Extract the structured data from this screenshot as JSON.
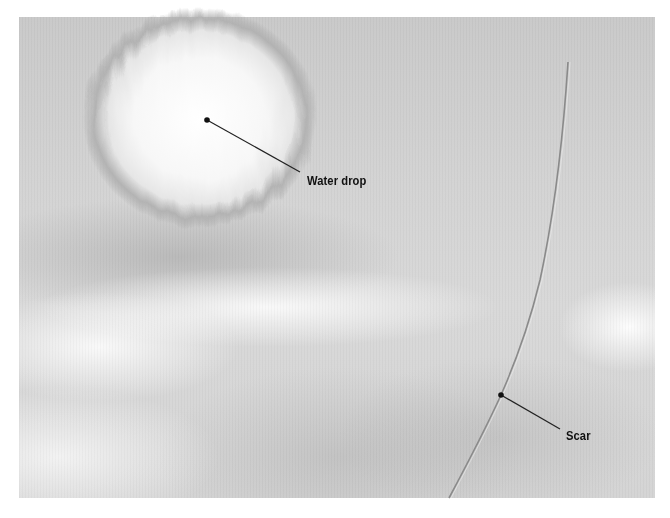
{
  "image": {
    "description": "Grayscale macro photograph of a surface showing a water drop and a scar, with two callout labels",
    "background_color": "#ffffff",
    "photo_tone": "#d3d3d3"
  },
  "annotations": [
    {
      "label": "Water drop",
      "point": [
        207,
        120
      ],
      "leader_end": [
        300,
        172
      ],
      "label_pos": [
        307,
        174
      ]
    },
    {
      "label": "Scar",
      "point": [
        501,
        395
      ],
      "leader_end": [
        560,
        429
      ],
      "label_pos": [
        566,
        429
      ]
    }
  ],
  "colors": {
    "label_text": "#111111",
    "leader_line": "#222222",
    "scar_line": "#8a8a8a"
  }
}
